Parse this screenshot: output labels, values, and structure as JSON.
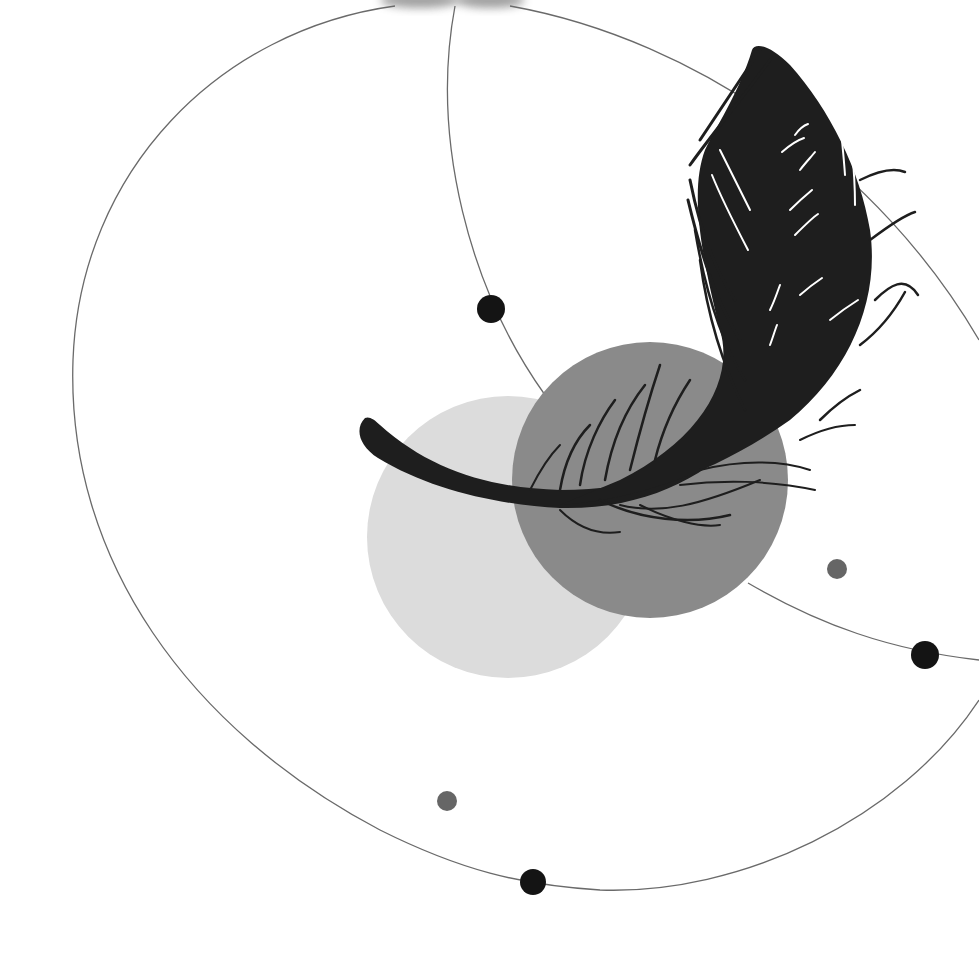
{
  "illustration": {
    "subject": "feather with orbiting circles and dots",
    "background_color": "#ffffff",
    "colors": {
      "feather": "#1e1e1e",
      "circle_light": "#dcdcdc",
      "circle_mid": "#8a8a8a",
      "orbit_line": "#6a6a6a",
      "dot_dark": "#141414",
      "dot_gray": "#666666"
    },
    "circles": [
      {
        "name": "light-circle",
        "cx": 508,
        "cy": 537,
        "r": 141
      },
      {
        "name": "mid-circle",
        "cx": 650,
        "cy": 480,
        "r": 138
      }
    ],
    "dots": [
      {
        "name": "dark-dot-upper",
        "cx": 491,
        "cy": 309,
        "r": 14
      },
      {
        "name": "dark-dot-right",
        "cx": 925,
        "cy": 655,
        "r": 14
      },
      {
        "name": "dark-dot-bottom",
        "cx": 533,
        "cy": 882,
        "r": 13
      },
      {
        "name": "gray-dot-right",
        "cx": 837,
        "cy": 569,
        "r": 10
      },
      {
        "name": "gray-dot-bottom",
        "cx": 447,
        "cy": 801,
        "r": 10
      }
    ]
  }
}
